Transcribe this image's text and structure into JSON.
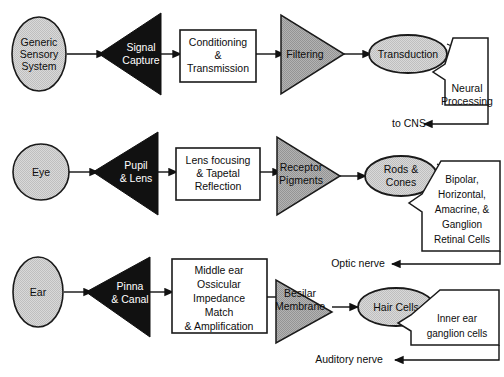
{
  "diagram": {
    "colors": {
      "ellipse_fill": "#d4d4d4",
      "triangle_dark_fill": "#111111",
      "triangle_gray_fill": "#a8a8a8",
      "box_fill": "#ffffff",
      "stroke": "#1a1a1a",
      "text": "#0d0d0d",
      "text_inverse": "#ffffff"
    },
    "rows": [
      {
        "id": "generic",
        "source": {
          "label_lines": [
            "Generic",
            "Sensory",
            "System"
          ],
          "shape": "ellipse"
        },
        "stage1": {
          "label_lines": [
            "Signal",
            "Capture"
          ],
          "shape": "triangle-left-dark"
        },
        "stage2": {
          "label_lines": [
            "Conditioning",
            "&",
            "Transmission"
          ],
          "shape": "rectangle"
        },
        "stage3": {
          "label_lines": [
            "Filtering"
          ],
          "shape": "triangle-right-gray"
        },
        "stage4": {
          "label_lines": [
            "Transduction"
          ],
          "shape": "ellipse"
        },
        "stage5": {
          "label_lines": [
            "Neural",
            "Processing"
          ],
          "shape": "chevron-polygon"
        },
        "output": {
          "label": "to CNS"
        }
      },
      {
        "id": "eye",
        "source": {
          "label_lines": [
            "Eye"
          ],
          "shape": "ellipse"
        },
        "stage1": {
          "label_lines": [
            "Pupil",
            "& Lens"
          ],
          "shape": "triangle-left-dark"
        },
        "stage2": {
          "label_lines": [
            "Lens focusing",
            "& Tapetal",
            "Reflection"
          ],
          "shape": "rectangle"
        },
        "stage3": {
          "label_lines": [
            "Receptor",
            "Pigments"
          ],
          "shape": "triangle-right-gray"
        },
        "stage4": {
          "label_lines": [
            "Rods &",
            "Cones"
          ],
          "shape": "ellipse"
        },
        "stage5": {
          "label_lines": [
            "Bipolar,",
            "Horizontal,",
            "Amacrine, &",
            "Ganglion",
            "Retinal Cells"
          ],
          "shape": "chevron-polygon"
        },
        "output": {
          "label": "Optic nerve"
        }
      },
      {
        "id": "ear",
        "source": {
          "label_lines": [
            "Ear"
          ],
          "shape": "ellipse"
        },
        "stage1": {
          "label_lines": [
            "Pinna",
            "& Canal"
          ],
          "shape": "triangle-left-dark"
        },
        "stage2": {
          "label_lines": [
            "Middle ear",
            "Ossicular",
            "Impedance",
            "Match",
            "& Amplification"
          ],
          "shape": "rectangle"
        },
        "stage3": {
          "label_lines": [
            "Besilar",
            "Membrane"
          ],
          "shape": "triangle-right-gray"
        },
        "stage4": {
          "label_lines": [
            "Hair Cells"
          ],
          "shape": "ellipse"
        },
        "stage5": {
          "label_lines": [
            "Inner ear",
            "ganglion cells"
          ],
          "shape": "chevron-polygon"
        },
        "output": {
          "label": "Auditory nerve"
        }
      }
    ]
  }
}
